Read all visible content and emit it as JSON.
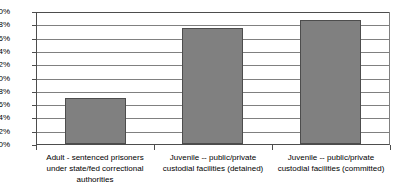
{
  "chart_data": {
    "type": "bar",
    "title": "",
    "subtitle": "",
    "xlabel": "",
    "ylabel": "",
    "categories": [
      "Adult - sentenced prisoners under state/fed correctional authorities",
      "Juvenile -- public/private custodial facilities (detained)",
      "Juvenile -- public/private custodial facilities (committed)"
    ],
    "values": [
      6.9,
      17.5,
      18.6
    ],
    "ylim": [
      0,
      20
    ],
    "ytick_values": [
      20,
      18,
      16,
      14,
      12,
      10,
      8,
      6,
      4,
      2,
      0
    ],
    "ytick_labels": [
      "20%",
      "18%",
      "16%",
      "14%",
      "12%",
      "10%",
      "8%",
      "6%",
      "4%",
      "2%",
      "0%"
    ],
    "grid": true,
    "legend": false,
    "legend_position": "none",
    "series": [
      {
        "name": "",
        "values": [
          6.9,
          17.5,
          18.6
        ]
      }
    ]
  },
  "colors": {
    "bar_fill": "#808080",
    "bar_border": "#4d4d4d",
    "gridline": "#808080",
    "axis": "#4d4d4d",
    "background": "#ffffff",
    "text": "#000000"
  }
}
